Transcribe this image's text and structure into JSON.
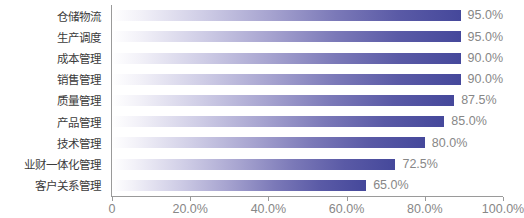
{
  "chart_data": {
    "type": "bar",
    "orientation": "horizontal",
    "title": "",
    "xlabel": "",
    "ylabel": "",
    "categories": [
      "仓储物流",
      "生产调度",
      "成本管理",
      "销售管理",
      "质量管理",
      "产品管理",
      "技术管理",
      "业财一体化管理",
      "客户关系管理"
    ],
    "values": [
      95.0,
      95.0,
      90.0,
      90.0,
      87.5,
      85.0,
      80.0,
      72.5,
      65.0
    ],
    "value_labels": [
      "95.0%",
      "95.0%",
      "90.0%",
      "90.0%",
      "87.5%",
      "85.0%",
      "80.0%",
      "72.5%",
      "65.0%"
    ],
    "xlim": [
      0,
      100
    ],
    "xticks": [
      0,
      20,
      40,
      60,
      80,
      100
    ],
    "xtick_labels": [
      "0",
      "20.0%",
      "40.0%",
      "60.0%",
      "80.0%",
      "100.0%"
    ],
    "grid": false,
    "legend": null,
    "colors": {
      "bar_gradient_start": "#ffffff",
      "bar_gradient_end": "#45489b",
      "axis_line": "#9a9a9a",
      "category_label_text": "#3b3b3b",
      "value_label_text": "#878787",
      "tick_label_text": "#878787",
      "background": "#ffffff"
    }
  }
}
